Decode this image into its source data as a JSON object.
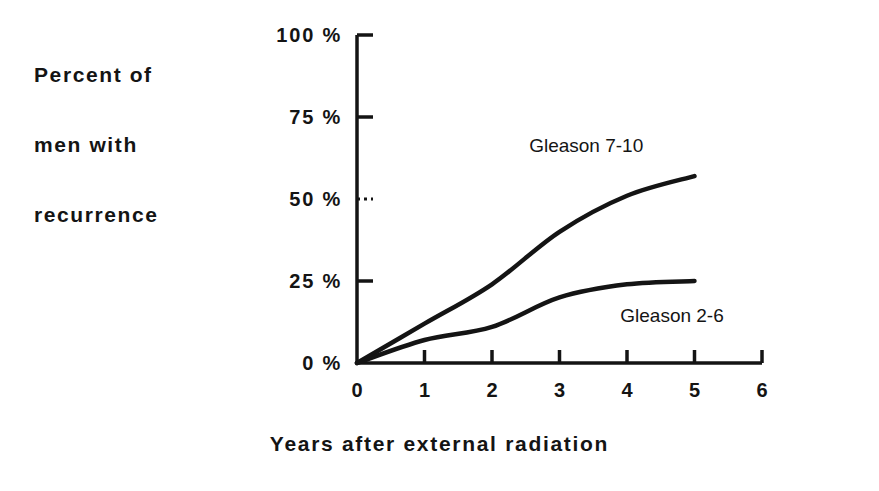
{
  "chart_data": {
    "type": "line",
    "title": "",
    "xlabel": "Years after external radiation",
    "ylabel": "Percent of men with recurrence",
    "ylabel_lines": [
      "Percent of",
      "men with",
      "recurrence"
    ],
    "x": [
      0,
      1,
      2,
      3,
      4,
      5
    ],
    "xlim": [
      0,
      6
    ],
    "ylim": [
      0,
      100
    ],
    "xticks": [
      0,
      1,
      2,
      3,
      4,
      5,
      6
    ],
    "xtick_labels": [
      "0",
      "1",
      "2",
      "3",
      "4",
      "5",
      "6"
    ],
    "yticks": [
      0,
      25,
      50,
      75,
      100
    ],
    "ytick_labels": [
      "0 %",
      "25 %",
      "50 %",
      "75 %",
      "100 %"
    ],
    "grid": false,
    "legend_position": "inline-annotations",
    "series": [
      {
        "name": "Gleason 7-10",
        "values": [
          0,
          12,
          24,
          40,
          51,
          57
        ],
        "color": "#141414",
        "label_x_year": 2.55,
        "label_y_percent": 66
      },
      {
        "name": "Gleason 2-6",
        "values": [
          0,
          7,
          11,
          20,
          24,
          25
        ],
        "color": "#141414",
        "label_x_year": 3.9,
        "label_y_percent": 14
      }
    ],
    "annotations": [
      {
        "text": "Gleason 7-10"
      },
      {
        "text": "Gleason 2-6"
      }
    ],
    "axis_color": "#141414"
  },
  "figure": {
    "background": "#ffffff",
    "ink_color": "#141414"
  }
}
